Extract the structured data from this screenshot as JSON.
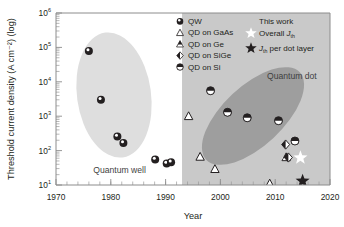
{
  "chart_data": {
    "type": "scatter",
    "title": "",
    "xlabel": "Year",
    "ylabel": "Threshold current density (A cm⁻²) (log)",
    "xlim": [
      1970,
      2020
    ],
    "ylim": [
      10,
      1000000
    ],
    "y_scale": "log",
    "grid": false,
    "x_ticks": [
      "1970",
      "1980",
      "1990",
      "2000",
      "2010",
      "2020"
    ],
    "y_ticks": [
      "10¹",
      "10²",
      "10³",
      "10⁴",
      "10⁵",
      "10⁶"
    ],
    "y_tick_mantissa": [
      "10",
      "10",
      "10",
      "10",
      "10",
      "10"
    ],
    "y_tick_exponents": [
      "1",
      "2",
      "3",
      "4",
      "5",
      "6"
    ],
    "legend_position": "top-right-inside",
    "shaded_band": {
      "label": "",
      "x_start": 1993,
      "x_end": 2020
    },
    "regions": [
      {
        "name": "quantum-well-region",
        "label": "Quantum well",
        "label_x": 1976.8,
        "label_y": 23
      },
      {
        "name": "quantum-dot-region",
        "label": "Quantum dot",
        "label_x": 2008.5,
        "label_y": 12000
      }
    ],
    "series": [
      {
        "name": "QW",
        "marker": "circle-top-filled",
        "points": [
          {
            "x": 1976.0,
            "y": 78000
          },
          {
            "x": 1978.2,
            "y": 3000
          },
          {
            "x": 1981.2,
            "y": 255
          },
          {
            "x": 1982.3,
            "y": 165
          },
          {
            "x": 1988.1,
            "y": 55
          },
          {
            "x": 1990.2,
            "y": 42
          },
          {
            "x": 1991.0,
            "y": 46
          }
        ]
      },
      {
        "name": "QD on GaAs",
        "marker": "triangle-open",
        "points": [
          {
            "x": 1994.2,
            "y": 1000
          },
          {
            "x": 1996.3,
            "y": 66
          },
          {
            "x": 1999.0,
            "y": 29
          },
          {
            "x": 2009.0,
            "y": 11
          }
        ]
      },
      {
        "name": "QD on Ge",
        "marker": "triangle-half",
        "points": [
          {
            "x": 2012.0,
            "y": 64
          }
        ]
      },
      {
        "name": "QD on SiGe",
        "marker": "diamond-half",
        "points": [
          {
            "x": 2011.9,
            "y": 150
          },
          {
            "x": 2012.4,
            "y": 63
          }
        ]
      },
      {
        "name": "QD on Si",
        "marker": "circle-half",
        "points": [
          {
            "x": 1998.2,
            "y": 5500
          },
          {
            "x": 2001.3,
            "y": 1300
          },
          {
            "x": 2004.9,
            "y": 900
          },
          {
            "x": 2010.6,
            "y": 740
          },
          {
            "x": 2013.6,
            "y": 190
          }
        ]
      },
      {
        "name": "Overall Jth",
        "marker": "star-white",
        "points": [
          {
            "x": 2014.6,
            "y": 62
          }
        ]
      },
      {
        "name": "Jth per dot layer",
        "marker": "star-black",
        "points": [
          {
            "x": 2015.0,
            "y": 13
          }
        ]
      }
    ]
  },
  "legend": {
    "items": [
      {
        "marker": "circle-top-filled",
        "label": "QW",
        "icon_name": "qw-marker-icon"
      },
      {
        "marker": "triangle-open",
        "label": "QD on GaAs",
        "icon_name": "qd-gaas-marker-icon"
      },
      {
        "marker": "triangle-half",
        "label": "QD on Ge",
        "icon_name": "qd-ge-marker-icon"
      },
      {
        "marker": "diamond-half",
        "label": "QD on SiGe",
        "icon_name": "qd-sige-marker-icon"
      },
      {
        "marker": "circle-half",
        "label": "QD on Si",
        "icon_name": "qd-si-marker-icon"
      }
    ],
    "this_work": {
      "heading": "This work",
      "entries": [
        {
          "marker": "star-white",
          "label_main": "Overall ",
          "label_italic": "J",
          "label_sub": "th",
          "icon_name": "overall-jth-star-icon"
        },
        {
          "marker": "star-black",
          "label_italic": "J",
          "label_sub": "th",
          "label_tail": " per dot layer",
          "icon_name": "jth-per-dot-layer-star-icon"
        }
      ]
    }
  },
  "colors": {
    "axis": "#8c8c8c",
    "text": "#231f20",
    "band": "#c9c9c9",
    "qw_ellipse": "#dcdcdc",
    "qd_ellipse": "#9e9e9e",
    "marker_dark": "#231f20",
    "marker_white": "#ffffff",
    "legend_bg": "#c9c9c9"
  }
}
